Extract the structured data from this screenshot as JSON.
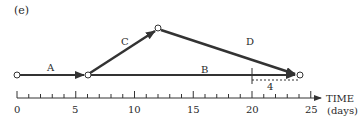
{
  "figure": {
    "panel_label": "(e)",
    "activities": [
      {
        "name": "A",
        "from_day": 0,
        "to_day": 6,
        "label": "A"
      },
      {
        "name": "B",
        "from_day": 6,
        "to_day": 24,
        "label": "B"
      },
      {
        "name": "C",
        "from_day": 6,
        "to_day": 12,
        "label": "C"
      },
      {
        "name": "D",
        "from_day": 12,
        "to_day": 24,
        "label": "D"
      }
    ],
    "float": {
      "start_day": 20,
      "end_day": 24,
      "label": "4"
    },
    "axis": {
      "title": "TIME",
      "unit": "(days)",
      "ticks": [
        "0",
        "5",
        "10",
        "15",
        "20",
        "25"
      ],
      "min": 0,
      "max": 25
    },
    "colors": {
      "line": "#333333",
      "node_fill": "#ffffff"
    }
  }
}
